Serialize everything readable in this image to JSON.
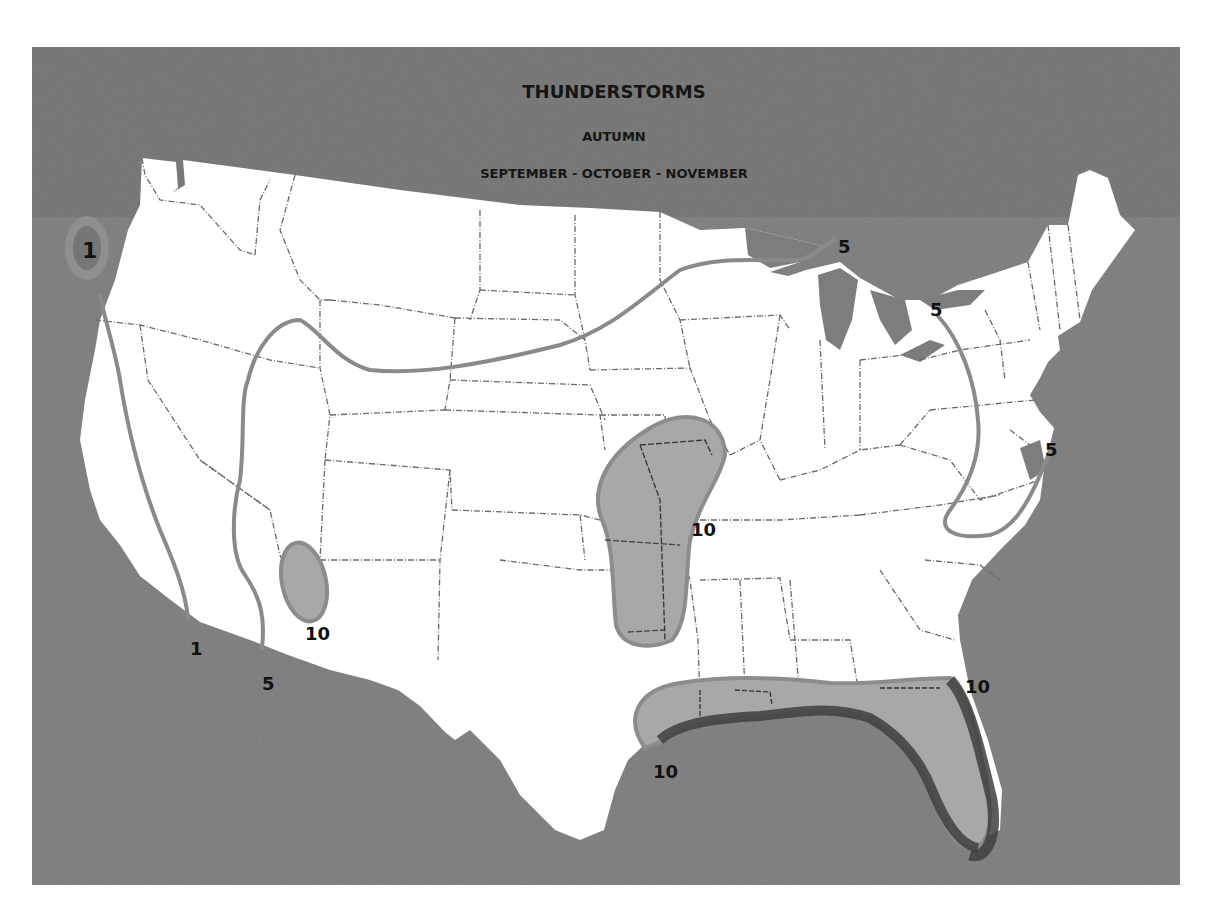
{
  "map": {
    "title": "THUNDERSTORMS",
    "season": "AUTUMN",
    "months": "SEPTEMBER - OCTOBER - NOVEMBER",
    "colors": {
      "ocean": "#7d7d7d",
      "land": "#ffffff",
      "isoline": "#8a8a8a",
      "region_fill": "#a8a8a8",
      "region_edge": "#8c8c8c",
      "coast_shadow": "#4a4a4a",
      "state_border": "#6a6a6a"
    },
    "isolines": [
      {
        "value": "1",
        "label": "1",
        "description": "Pacific coast line, northwest Washington to southern California"
      },
      {
        "value": "5",
        "label": "5",
        "description": "Western/northern line from southern California through Nevada, Utah, across northern plains to Upper Michigan"
      },
      {
        "value": "5",
        "label": "5",
        "description": "Eastern loop from Lake Ontario through Pennsylvania, Virginia to Delmarva coast"
      }
    ],
    "regions": [
      {
        "value": "10",
        "label": "10",
        "location": "Arizona"
      },
      {
        "value": "10",
        "label": "10",
        "location": "Kansas / Oklahoma / Missouri"
      },
      {
        "value": "10",
        "label": "10",
        "location": "Gulf Coast (Texas to Florida)"
      }
    ],
    "labels": [
      {
        "id": "nw-1",
        "text": "1"
      },
      {
        "id": "sw-1",
        "text": "1"
      },
      {
        "id": "sw-5",
        "text": "5"
      },
      {
        "id": "az-10",
        "text": "10"
      },
      {
        "id": "mw-5",
        "text": "5"
      },
      {
        "id": "ne-5",
        "text": "5"
      },
      {
        "id": "mid-atl-5",
        "text": "5"
      },
      {
        "id": "plains-10",
        "text": "10"
      },
      {
        "id": "tx-10",
        "text": "10"
      },
      {
        "id": "fl-10",
        "text": "10"
      }
    ]
  }
}
